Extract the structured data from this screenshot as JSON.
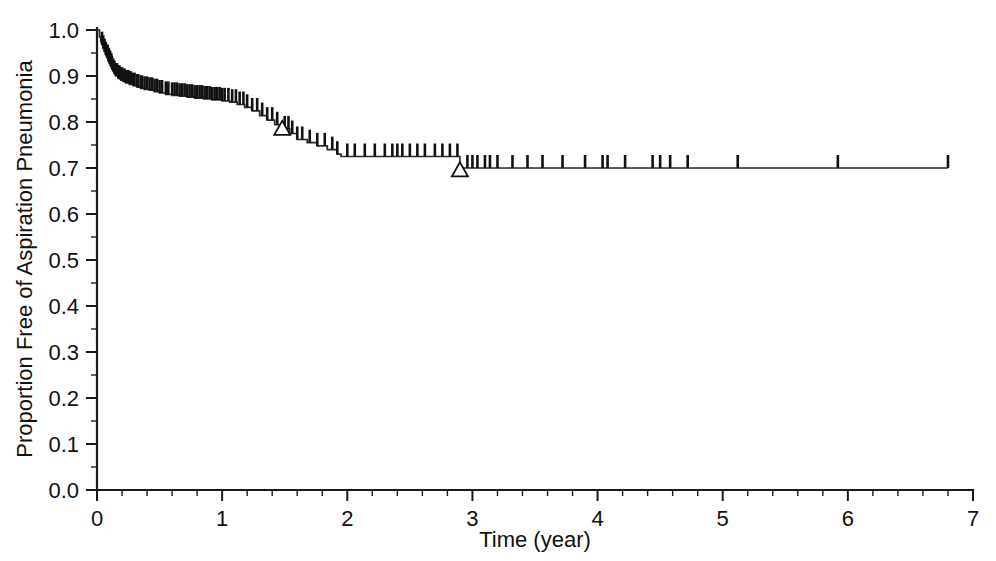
{
  "chart_data": {
    "type": "line",
    "subtype": "kaplan-meier-survival-curve",
    "title": "",
    "subtitle": "",
    "xlabel": "Time (year)",
    "ylabel": "Proportion Free of Aspiration Pneumonia",
    "xlim": [
      0,
      7
    ],
    "ylim": [
      0.0,
      1.0
    ],
    "grid": false,
    "legend": null,
    "legend_position": "none",
    "x_ticks": [
      0,
      1,
      2,
      3,
      4,
      5,
      6,
      7
    ],
    "x_tick_labels": [
      "0",
      "1",
      "2",
      "3",
      "4",
      "5",
      "6",
      "7"
    ],
    "x_minor_tick_interval": 0.2,
    "y_ticks": [
      0.0,
      0.1,
      0.2,
      0.3,
      0.4,
      0.5,
      0.6,
      0.7,
      0.8,
      0.9,
      1.0
    ],
    "y_tick_labels": [
      "0.0",
      "0.1",
      "0.2",
      "0.3",
      "0.4",
      "0.5",
      "0.6",
      "0.7",
      "0.8",
      "0.9",
      "1.0"
    ],
    "y_minor_tick_interval": 0.05,
    "curve_color": "#2b2b2b",
    "background_color": "#ffffff",
    "series": [
      {
        "name": "Freedom from aspiration pneumonia",
        "step": "post",
        "x": [
          0.0,
          0.02,
          0.03,
          0.04,
          0.05,
          0.06,
          0.07,
          0.08,
          0.09,
          0.1,
          0.11,
          0.12,
          0.13,
          0.14,
          0.15,
          0.17,
          0.19,
          0.21,
          0.23,
          0.26,
          0.29,
          0.32,
          0.35,
          0.38,
          0.42,
          0.46,
          0.5,
          0.55,
          0.6,
          0.66,
          0.72,
          0.78,
          0.85,
          0.92,
          1.0,
          1.06,
          1.12,
          1.18,
          1.24,
          1.3,
          1.36,
          1.42,
          1.48,
          1.54,
          1.6,
          1.68,
          1.76,
          1.84,
          1.92,
          1.95,
          2.1,
          2.3,
          2.5,
          2.7,
          2.88,
          2.9,
          3.2,
          3.6,
          4.0,
          4.4,
          4.8,
          5.2,
          5.6,
          6.0,
          6.4,
          6.8
        ],
        "y": [
          1.0,
          0.985,
          0.975,
          0.968,
          0.96,
          0.953,
          0.946,
          0.94,
          0.933,
          0.927,
          0.921,
          0.915,
          0.91,
          0.905,
          0.9,
          0.895,
          0.891,
          0.888,
          0.885,
          0.882,
          0.879,
          0.876,
          0.873,
          0.871,
          0.869,
          0.866,
          0.863,
          0.86,
          0.858,
          0.856,
          0.854,
          0.852,
          0.85,
          0.848,
          0.846,
          0.843,
          0.838,
          0.832,
          0.824,
          0.814,
          0.804,
          0.794,
          0.785,
          0.775,
          0.762,
          0.755,
          0.748,
          0.74,
          0.73,
          0.725,
          0.725,
          0.725,
          0.725,
          0.725,
          0.725,
          0.7,
          0.7,
          0.7,
          0.7,
          0.7,
          0.7,
          0.7,
          0.7,
          0.7,
          0.7,
          0.7
        ]
      }
    ],
    "censored_times": [
      0.04,
      0.05,
      0.06,
      0.07,
      0.08,
      0.085,
      0.09,
      0.095,
      0.1,
      0.105,
      0.11,
      0.115,
      0.12,
      0.13,
      0.14,
      0.15,
      0.16,
      0.17,
      0.18,
      0.19,
      0.2,
      0.21,
      0.22,
      0.23,
      0.25,
      0.26,
      0.27,
      0.29,
      0.3,
      0.32,
      0.33,
      0.35,
      0.36,
      0.38,
      0.4,
      0.42,
      0.44,
      0.46,
      0.48,
      0.5,
      0.52,
      0.55,
      0.57,
      0.6,
      0.62,
      0.64,
      0.66,
      0.68,
      0.7,
      0.72,
      0.74,
      0.76,
      0.78,
      0.8,
      0.82,
      0.84,
      0.86,
      0.88,
      0.9,
      0.92,
      0.94,
      0.96,
      0.98,
      1.0,
      1.02,
      1.05,
      1.08,
      1.11,
      1.14,
      1.17,
      1.2,
      1.24,
      1.28,
      1.32,
      1.36,
      1.4,
      1.44,
      1.5,
      1.53,
      1.56,
      1.6,
      1.64,
      1.7,
      1.76,
      1.82,
      1.88,
      1.92,
      2.0,
      2.06,
      2.14,
      2.22,
      2.3,
      2.36,
      2.4,
      2.44,
      2.5,
      2.56,
      2.62,
      2.7,
      2.76,
      2.82,
      2.88,
      2.96,
      3.0,
      3.04,
      3.1,
      3.14,
      3.2,
      3.32,
      3.44,
      3.56,
      3.72,
      3.9,
      4.04,
      4.08,
      4.22,
      4.44,
      4.5,
      4.58,
      4.72,
      5.12,
      5.92,
      6.8
    ],
    "event_markers": [
      {
        "shape": "open-triangle",
        "x": 1.48,
        "y": 0.785
      },
      {
        "shape": "open-triangle",
        "x": 2.9,
        "y": 0.695
      }
    ],
    "annotations": []
  },
  "axes": {
    "y_axis_title": "Proportion Free of Aspiration Pneumonia",
    "x_axis_title": "Time (year)"
  }
}
